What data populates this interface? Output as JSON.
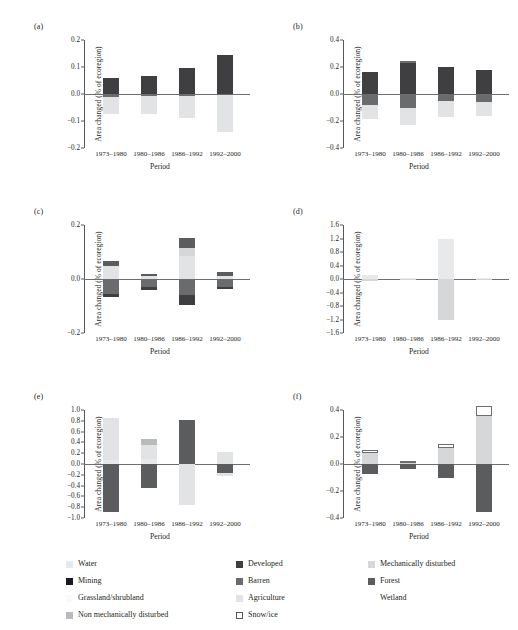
{
  "figure": {
    "xlabel": "Period",
    "ylabel": "Area changed (% of ecoregion)",
    "categories": [
      "1973–1980",
      "1980–1986",
      "1986–1992",
      "1992–2000"
    ]
  },
  "colors": {
    "water": "#e8e9ea",
    "developed": "#3f3f41",
    "mechanically_disturbed": "#d6d7d8",
    "mining": "#1a1a1a",
    "barren": "#6a6b6d",
    "forest": "#5b5c5e",
    "grassland_shrubland": "#fafafa",
    "agriculture": "#e2e3e4",
    "wetland": "#ffffff",
    "non_mechanically_disturbed": "#b9babb",
    "snow_ice": "#ffffff",
    "axis": "#58585b",
    "zero_line": "#6d6e71"
  },
  "legend": {
    "items": [
      {
        "label": "Water",
        "key": "water",
        "bordered": false
      },
      {
        "label": "Developed",
        "key": "developed",
        "bordered": false
      },
      {
        "label": "Mechanically disturbed",
        "key": "mechanically_disturbed",
        "bordered": false
      },
      {
        "label": "Mining",
        "key": "mining",
        "bordered": false
      },
      {
        "label": "Barren",
        "key": "barren",
        "bordered": false
      },
      {
        "label": "Forest",
        "key": "forest",
        "bordered": false
      },
      {
        "label": "Grassland/shrubland",
        "key": "grassland_shrubland",
        "bordered": false
      },
      {
        "label": "Agriculture",
        "key": "agriculture",
        "bordered": false
      },
      {
        "label": "Wetland",
        "key": "wetland",
        "bordered": false
      },
      {
        "label": "Non mechanically disturbed",
        "key": "non_mechanically_disturbed",
        "bordered": false
      },
      {
        "label": "Snow/ice",
        "key": "snow_ice",
        "bordered": true
      }
    ]
  },
  "chart_data": [
    {
      "panel": "(a)",
      "type": "bar",
      "stacked": true,
      "xlabel": "Period",
      "ylabel": "Area changed (% of ecoregion)",
      "categories": [
        "1973–1980",
        "1980–1986",
        "1986–1992",
        "1992–2000"
      ],
      "ylim": [
        -0.2,
        0.2
      ],
      "yticks": [
        0.2,
        0.1,
        0.0,
        -0.1,
        -0.2
      ],
      "yticklabels": [
        "0.2",
        "0.1",
        "0.0",
        "-0.1",
        "-0.2"
      ],
      "grid": false,
      "series": [
        {
          "name": "Developed",
          "key": "developed",
          "values": [
            0.06,
            0.068,
            0.096,
            0.143
          ]
        },
        {
          "name": "Barren",
          "key": "barren",
          "values": [
            -0.012,
            -0.008,
            -0.006,
            -0.005
          ]
        },
        {
          "name": "Agriculture",
          "key": "agriculture",
          "values": [
            -0.062,
            -0.065,
            -0.082,
            -0.137
          ]
        }
      ]
    },
    {
      "panel": "(b)",
      "type": "bar",
      "stacked": true,
      "xlabel": "Period",
      "ylabel": "Area changed (% of ecoregion)",
      "categories": [
        "1973–1980",
        "1980–1986",
        "1986–1992",
        "1992–2000"
      ],
      "ylim": [
        -0.4,
        0.4
      ],
      "yticks": [
        0.4,
        0.2,
        0.0,
        -0.2,
        -0.4
      ],
      "yticklabels": [
        "0.4",
        "0.2",
        "0.0",
        "-0.2",
        "-0.4"
      ],
      "grid": false,
      "series": [
        {
          "name": "Developed",
          "key": "developed",
          "values": [
            0.165,
            0.228,
            0.197,
            0.175
          ]
        },
        {
          "name": "Snow/ice",
          "key": "snow_ice",
          "values": [
            0.0,
            0.016,
            0.0,
            0.0
          ]
        },
        {
          "name": "Barren",
          "key": "barren",
          "values": [
            -0.082,
            -0.102,
            -0.055,
            -0.06
          ]
        },
        {
          "name": "Agriculture",
          "key": "agriculture",
          "values": [
            -0.1,
            -0.13,
            -0.115,
            -0.1
          ]
        }
      ]
    },
    {
      "panel": "(c)",
      "type": "bar",
      "stacked": true,
      "xlabel": "Period",
      "ylabel": "Area changed (% of ecoregion)",
      "categories": [
        "1973–1980",
        "1980–1986",
        "1986–1992",
        "1992–2000"
      ],
      "ylim": [
        -0.2,
        0.2
      ],
      "yticks": [
        0.2,
        0.0,
        -0.2
      ],
      "yticklabels": [
        "0.2",
        "0.0",
        "-0.2"
      ],
      "grid": false,
      "series": [
        {
          "name": "Agriculture",
          "key": "agriculture",
          "values": [
            0.047,
            0.01,
            0.085,
            0.012
          ]
        },
        {
          "name": "Mechanically disturbed",
          "key": "mechanically_disturbed",
          "values": [
            0.0,
            0.0,
            0.028,
            0.0
          ]
        },
        {
          "name": "Forest",
          "key": "forest",
          "values": [
            0.018,
            0.01,
            0.04,
            0.014
          ]
        },
        {
          "name": "Barren",
          "key": "barren",
          "values": [
            -0.055,
            -0.03,
            -0.06,
            -0.03
          ]
        },
        {
          "name": "Developed",
          "key": "developed",
          "values": [
            -0.01,
            -0.01,
            -0.035,
            -0.008
          ]
        }
      ]
    },
    {
      "panel": "(d)",
      "type": "bar",
      "stacked": true,
      "xlabel": "Period",
      "ylabel": "Area changed (% of ecoregion)",
      "categories": [
        "1973–1980",
        "1980–1986",
        "1986–1992",
        "1992–2000"
      ],
      "ylim": [
        -1.6,
        1.6
      ],
      "yticks": [
        1.6,
        1.2,
        0.8,
        0.4,
        0.0,
        -0.4,
        -0.8,
        -1.2,
        -1.6
      ],
      "yticklabels": [
        "1.6",
        "1.2",
        "0.8",
        "0.4",
        "0.0",
        "-0.4",
        "-0.8",
        "-1.2",
        "-1.6"
      ],
      "grid": false,
      "series": [
        {
          "name": "Water",
          "key": "water",
          "values": [
            0.12,
            0.02,
            1.18,
            0.02
          ]
        },
        {
          "name": "Mechanically disturbed",
          "key": "mechanically_disturbed",
          "values": [
            -0.06,
            -0.02,
            -1.2,
            -0.02
          ]
        }
      ]
    },
    {
      "panel": "(e)",
      "type": "bar",
      "stacked": true,
      "xlabel": "Period",
      "ylabel": "Area changed (% of ecoregion)",
      "categories": [
        "1973–1980",
        "1980–1986",
        "1986–1992",
        "1992–2000"
      ],
      "ylim": [
        -1.0,
        1.0
      ],
      "yticks": [
        1.0,
        0.8,
        0.6,
        0.4,
        0.2,
        0.0,
        -0.2,
        -0.4,
        -0.6,
        -0.8,
        -1.0
      ],
      "yticklabels": [
        "1.0",
        "0.8",
        "0.6",
        "0.4",
        "0.2",
        "0.0",
        "-0.2",
        "-0.4",
        "-0.6",
        "-0.8",
        "-1.0"
      ],
      "grid": false,
      "series": [
        {
          "name": "Water",
          "key": "water",
          "values": [
            0.07,
            0.09,
            0.0,
            0.0
          ]
        },
        {
          "name": "Agriculture",
          "key": "agriculture",
          "values": [
            0.78,
            0.26,
            0.0,
            0.23
          ]
        },
        {
          "name": "Non mechanically disturbed",
          "key": "non_mechanically_disturbed",
          "values": [
            0.0,
            0.12,
            0.0,
            0.0
          ]
        },
        {
          "name": "Forest",
          "key": "forest",
          "values": [
            -0.88,
            -0.45,
            0.81,
            -0.17
          ]
        },
        {
          "name": "Agriculture (loss)",
          "key": "agriculture",
          "values": [
            0.0,
            0.0,
            -0.76,
            -0.05
          ]
        }
      ]
    },
    {
      "panel": "(f)",
      "type": "bar",
      "stacked": true,
      "xlabel": "Period",
      "ylabel": "Area changed (% of ecoregion)",
      "categories": [
        "1973–1980",
        "1980–1986",
        "1986–1992",
        "1992–2000"
      ],
      "ylim": [
        -0.4,
        0.4
      ],
      "yticks": [
        0.4,
        0.2,
        0.0,
        -0.2,
        -0.4
      ],
      "yticklabels": [
        "0.4",
        "0.2",
        "0.0",
        "-0.2",
        "-0.4"
      ],
      "grid": false,
      "series": [
        {
          "name": "Mechanically disturbed",
          "key": "mechanically_disturbed",
          "values": [
            0.08,
            0.015,
            0.118,
            0.355
          ]
        },
        {
          "name": "Snow/ice",
          "key": "snow_ice",
          "values": [
            0.022,
            0.006,
            0.03,
            0.075
          ]
        },
        {
          "name": "Water",
          "key": "water",
          "values": [
            0.0,
            0.0,
            0.0,
            0.0
          ]
        },
        {
          "name": "Forest",
          "key": "forest",
          "values": [
            -0.072,
            -0.038,
            -0.1,
            -0.355
          ]
        }
      ]
    }
  ]
}
